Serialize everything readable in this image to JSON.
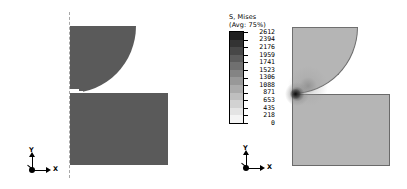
{
  "canvas": {
    "width": 407,
    "height": 189,
    "background": "#ffffff"
  },
  "legend": {
    "title": "S, Mises",
    "subtitle": "(Avg: 75%)",
    "values": [
      "2612",
      "2394",
      "2176",
      "1959",
      "1741",
      "1523",
      "1306",
      "1088",
      "871",
      "653",
      "435",
      "218",
      "0"
    ],
    "swatch_colors": [
      "#1f1f1f",
      "#333333",
      "#474747",
      "#5c5c5c",
      "#707070",
      "#848484",
      "#989898",
      "#ababab",
      "#bfbfbf",
      "#d2d2d2",
      "#e4e4e4",
      "#f4f4f4"
    ],
    "band_count": 12,
    "min_value": "0",
    "max_value": "2612"
  },
  "views": [
    {
      "id": "left",
      "name": "undeformed-model",
      "fill_color": "#5a5a5a",
      "triad": {
        "x_label": "X",
        "y_label": "Y"
      }
    },
    {
      "id": "right",
      "name": "stress-contour-model",
      "fill_color": "#b5b5b5",
      "edge_color": "#6a6a6a",
      "hotspot_color": "#141414",
      "triad": {
        "x_label": "X",
        "y_label": "Y"
      }
    }
  ],
  "chart_data": {
    "type": "heatmap",
    "title": "S, Mises",
    "subtitle": "(Avg: 75%)",
    "xlabel": "X",
    "ylabel": "Y",
    "legend_position": "center",
    "grid": false,
    "colorbar": {
      "label": "S, Mises",
      "orientation": "vertical",
      "colormap": "grayscale",
      "min": 0,
      "max": 2612,
      "ticks": [
        2612,
        2394,
        2176,
        1959,
        1741,
        1523,
        1306,
        1088,
        871,
        653,
        435,
        218,
        0
      ],
      "interval": 218,
      "bands": 12
    },
    "panels": [
      {
        "name": "undeformed-mesh",
        "description": "Cylindrical indenter quarter-section above rectangular base block, uniform fill",
        "value_uniform": 0
      },
      {
        "name": "von-mises-contour",
        "description": "Hertzian contact stress field, peak concentrated at indenter/base contact point",
        "peak_value": 2612,
        "peak_location": [
          0.0,
          0.0
        ],
        "background_value": 218
      }
    ]
  }
}
